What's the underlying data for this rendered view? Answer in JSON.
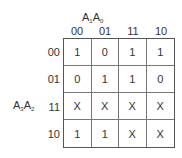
{
  "kmap": {
    "col_var": {
      "v1": "A",
      "s1": "1",
      "v2": "A",
      "s2": "0"
    },
    "row_var": {
      "v1": "A",
      "s1": "3",
      "v2": "A",
      "s2": "2"
    },
    "col_headers": [
      "00",
      "01",
      "11",
      "10"
    ],
    "row_headers": [
      "00",
      "01",
      "11",
      "10"
    ],
    "cells": [
      [
        "1",
        "0",
        "1",
        "1"
      ],
      [
        "0",
        "1",
        "1",
        "0"
      ],
      [
        "X",
        "X",
        "X",
        "X"
      ],
      [
        "1",
        "1",
        "X",
        "X"
      ]
    ]
  }
}
